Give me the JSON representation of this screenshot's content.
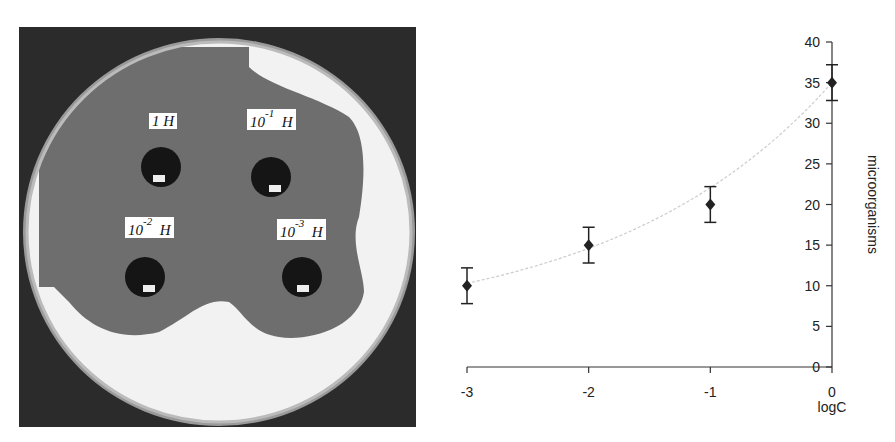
{
  "figure": {
    "photo": {
      "description": "petri dish with four wells showing inhibition zones",
      "wells": [
        {
          "label_base": "1",
          "label_exp": "",
          "label_unit": "H"
        },
        {
          "label_base": "10",
          "label_exp": "-1",
          "label_unit": "H"
        },
        {
          "label_base": "10",
          "label_exp": "-2",
          "label_unit": "H"
        },
        {
          "label_base": "10",
          "label_exp": "-3",
          "label_unit": "H"
        }
      ]
    }
  },
  "chart_data": {
    "type": "scatter",
    "title": "",
    "xlabel": "logC",
    "ylabel": "microorganisms",
    "x": [
      -3,
      -2,
      -1,
      0
    ],
    "series": [
      {
        "name": "microorganisms",
        "values": [
          10,
          15,
          20,
          35
        ],
        "error": [
          2.2,
          2.2,
          2.2,
          2.2
        ],
        "marker": "diamond"
      }
    ],
    "trendline": {
      "style": "dotted",
      "color": "#cccccc",
      "type": "exponential"
    },
    "x_ticks": [
      "-3",
      "-2",
      "-1",
      "0"
    ],
    "y_ticks": [
      "0",
      "5",
      "10",
      "15",
      "20",
      "25",
      "30",
      "35",
      "40"
    ],
    "xlim": [
      -3,
      0
    ],
    "ylim": [
      0,
      40
    ],
    "y_axis_position": "right",
    "grid": false,
    "legend": null
  }
}
